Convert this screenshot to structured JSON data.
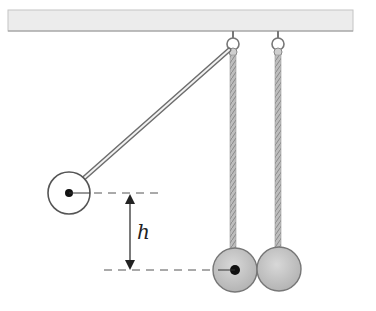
{
  "diagram": {
    "type": "pendulum-collision",
    "labels": {
      "height": "h"
    },
    "colors": {
      "background": "#ffffff",
      "ceiling_fill": "#ececec",
      "ceiling_edge": "#9a9a9a",
      "rope": "#a8a8a8",
      "rod": "#6e6e6e",
      "ball_shaded": "#c8c8c8",
      "ball_outline": "#555555",
      "ink": "#222222",
      "dash": "#555555"
    },
    "elements": {
      "ceiling": {
        "x": 8,
        "y": 10,
        "width": 345,
        "height": 21
      },
      "pivots": [
        {
          "x": 233,
          "y": 42
        },
        {
          "x": 278,
          "y": 42
        }
      ],
      "raised_ball": {
        "cx": 69,
        "cy": 193,
        "r": 21
      },
      "rest_balls": [
        {
          "cx": 235,
          "cy": 270,
          "r": 22
        },
        {
          "cx": 279,
          "cy": 269,
          "r": 22
        }
      ],
      "upper_dashed_y": 193,
      "lower_dashed_y": 270,
      "arrow_x": 130
    }
  }
}
